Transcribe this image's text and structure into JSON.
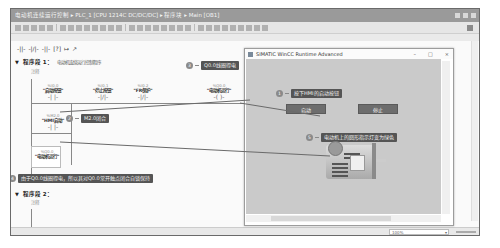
{
  "window": {
    "title": "电动机连续运行控制 ▸ PLC_1 [CPU 1214C DC/DC/DC] ▸ 程序块 ▸ Main [OB1]"
  },
  "lad_toolbar": {
    "items": [
      "-||-",
      "-|/|-",
      "-||-",
      "[?]",
      "↦",
      "↗"
    ]
  },
  "networks": [
    {
      "title": "程序段 1：",
      "comment_title": "电动机连续运行控制程序",
      "comment": "注释",
      "contacts": [
        {
          "addr": "%I0.0",
          "tag": "\"启动按钮\"",
          "symbol": "-| |-"
        },
        {
          "addr": "%I0.1",
          "tag": "\"停止按钮\"",
          "symbol": "-|/|-"
        },
        {
          "addr": "%I0.2",
          "tag": "\"FR保护\"",
          "symbol": "-|/|-"
        },
        {
          "addr": "%Q0.0",
          "tag": "\"电动机运行\"",
          "symbol": "-( )-"
        }
      ],
      "parallel_contact": {
        "addr": "%M2.0",
        "tag": "\"HMI启动\"",
        "symbol": "-| |-"
      },
      "seal_contact": {
        "addr": "%Q0.0",
        "tag": "\"电动机运行\""
      }
    },
    {
      "title": "程序段 2：",
      "comment": "注释"
    }
  ],
  "callouts": {
    "c1": {
      "num": "1",
      "text": "按下HMI的启动按钮"
    },
    "c2": {
      "num": "2",
      "text": "M2.0闭合"
    },
    "c3": {
      "num": "3",
      "text": "Q0.0线圈得电"
    },
    "c4": {
      "num": "4",
      "text": "由于Q0.0线圈得电，所以其对Q0.0常开触点闭合自锁保持"
    },
    "c5": {
      "num": "5",
      "text": "电动机上的圆形指示灯变为绿色"
    }
  },
  "hmi": {
    "title": "SIMATIC WinCC Runtime Advanced",
    "controls": {
      "minimize": "–",
      "maximize": "□",
      "close": "×"
    },
    "start_button": "启动",
    "stop_button": "停止"
  },
  "statusbar": {
    "zoom": "100%"
  },
  "colors": {
    "callout_bg": "#555555",
    "hmi_canvas": "#cacaca",
    "hmi_button": "#6d6d6d",
    "titlebar": "#9a9a9a"
  }
}
